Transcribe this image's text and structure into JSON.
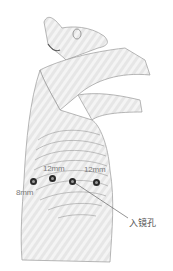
{
  "figure": {
    "ports": [
      {
        "id": "port-1",
        "size_label": "8mm",
        "x": 33,
        "y": 181
      },
      {
        "id": "port-2",
        "size_label": "12mm",
        "x": 52,
        "y": 178
      },
      {
        "id": "port-3",
        "role": "camera",
        "x": 72,
        "y": 181
      },
      {
        "id": "port-4",
        "size_label": "12mm",
        "x": 96,
        "y": 182
      }
    ],
    "labels": {
      "port_1": "8mm",
      "port_2": "12mm",
      "port_4": "12mm",
      "camera_port": "入镜孔"
    },
    "colors": {
      "sketch_line": "#8a8a8a",
      "port_ring": "#2a2a2a",
      "label_text": "#7a7a7a"
    }
  }
}
